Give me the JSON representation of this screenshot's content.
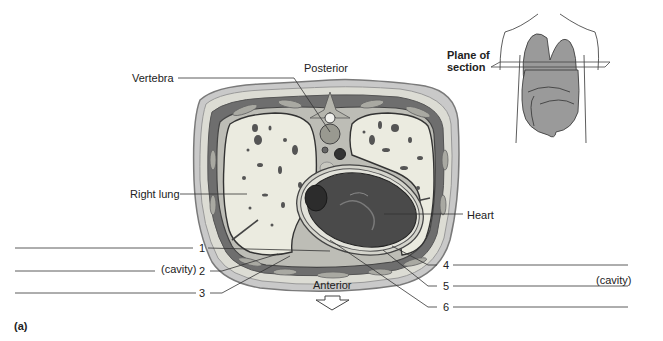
{
  "figure": {
    "panel_label": "(a)",
    "orientation": {
      "top": "Posterior",
      "bottom": "Anterior"
    },
    "inset": {
      "caption_line1": "Plane of",
      "caption_line2": "section"
    },
    "named_labels": {
      "vertebra": "Vertebra",
      "right_lung": "Right lung",
      "heart": "Heart"
    },
    "blank_labels": [
      {
        "number": "1",
        "suffix": ""
      },
      {
        "number": "2",
        "suffix": "(cavity)"
      },
      {
        "number": "3",
        "suffix": ""
      },
      {
        "number": "4",
        "suffix": ""
      },
      {
        "number": "5",
        "suffix": "(cavity)"
      },
      {
        "number": "6",
        "suffix": ""
      }
    ],
    "colors": {
      "skin": "#c9c9c9",
      "fat": "#dcdcd4",
      "muscle": "#6e6e6e",
      "lung": "#ebebe0",
      "heart": "#4a4a4a",
      "organ_fill": "#9a9a9a",
      "leader": "#333333"
    }
  }
}
